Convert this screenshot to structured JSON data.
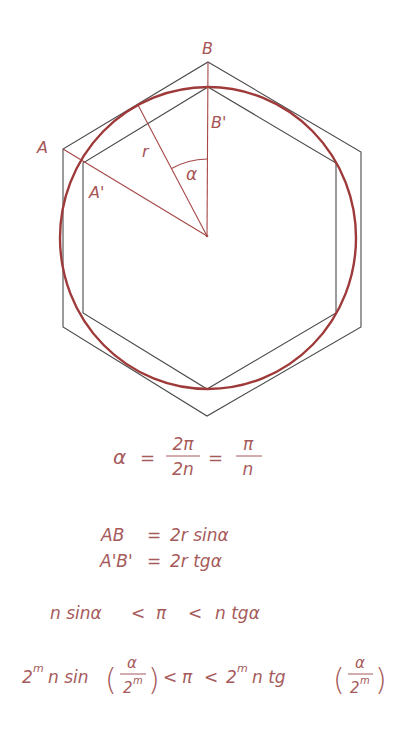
{
  "figure": {
    "colors": {
      "polygon_stroke": "#4a4a4a",
      "circle_stroke": "#9e3a3a",
      "construction_stroke": "#a64747",
      "label_color": "#a65555"
    },
    "labels": {
      "A": "A",
      "A_prime": "A'",
      "B": "B",
      "B_prime": "B'",
      "r": "r",
      "alpha": "α"
    }
  },
  "formulas": {
    "alpha_def": {
      "lhs": "α",
      "eq1": "=",
      "frac1_num": "2π",
      "frac1_den": "2n",
      "eq2": "=",
      "frac2_num": "π",
      "frac2_den": "n"
    },
    "ab": {
      "lhs": "AB",
      "eq": "=",
      "rhs": "2r sinα"
    },
    "apbp": {
      "lhs": "A'B'",
      "eq": "=",
      "rhs": "2r tgα"
    },
    "inequality1": {
      "left": "n sinα",
      "lt1": "<",
      "mid": "π",
      "lt2": "<",
      "right": "n tgα"
    },
    "inequality2": {
      "left_coef": "2",
      "left_exp": "m",
      "left_fn": "n sin",
      "left_paren_open": "(",
      "left_num": "α",
      "left_den_base": "2",
      "left_den_exp": "m",
      "left_paren_close": ")",
      "lt1": "<",
      "mid": "π",
      "lt2": "<",
      "right_coef": "2",
      "right_exp": "m",
      "right_fn": "n tg",
      "right_paren_open": "(",
      "right_num": "α",
      "right_den_base": "2",
      "right_den_exp": "m",
      "right_paren_close": ")"
    }
  }
}
